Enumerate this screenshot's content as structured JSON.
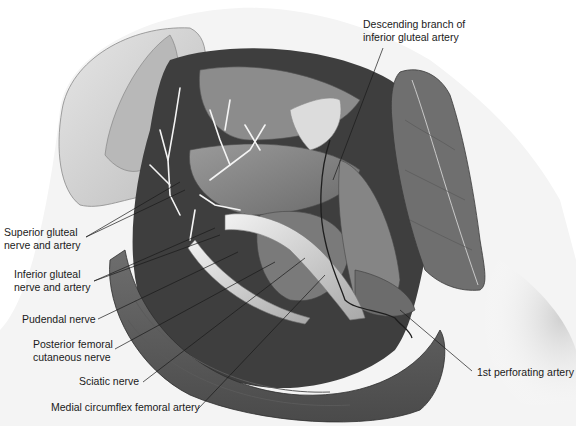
{
  "figure": {
    "labels": [
      {
        "id": "descending-branch",
        "lines": [
          "Descending branch of",
          "inferior gluteal artery"
        ]
      },
      {
        "id": "superior-gluteal",
        "lines": [
          "Superior gluteal",
          "nerve and artery"
        ]
      },
      {
        "id": "inferior-gluteal",
        "lines": [
          "Inferior gluteal",
          "nerve and artery"
        ]
      },
      {
        "id": "pudendal-nerve",
        "lines": [
          "Pudendal nerve"
        ]
      },
      {
        "id": "posterior-femoral-cutaneous",
        "lines": [
          "Posterior femoral",
          "cutaneous nerve"
        ]
      },
      {
        "id": "sciatic-nerve",
        "lines": [
          "Sciatic nerve"
        ]
      },
      {
        "id": "medial-circumflex",
        "lines": [
          "Medial circumflex femoral artery"
        ]
      },
      {
        "id": "first-perforating",
        "lines": [
          "1st perforating artery"
        ]
      }
    ]
  }
}
